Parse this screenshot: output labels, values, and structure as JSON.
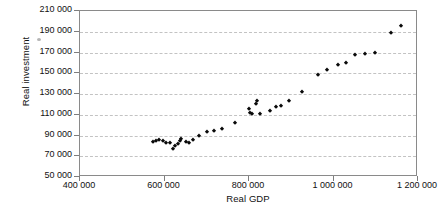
{
  "chart_data": {
    "type": "scatter",
    "title": "",
    "xlabel": "Real GDP",
    "ylabel": "Real investment",
    "xlim": [
      400000,
      1200000
    ],
    "ylim": [
      50000,
      210000
    ],
    "xticks": [
      400000,
      600000,
      800000,
      1000000,
      1200000
    ],
    "yticks": [
      50000,
      70000,
      90000,
      110000,
      130000,
      150000,
      170000,
      190000,
      210000
    ],
    "xtick_labels": [
      "400 000",
      "600 000",
      "800 000",
      "1 000 000",
      "1 200 000"
    ],
    "ytick_labels": [
      "50 000",
      "70 000",
      "90 000",
      "110 000",
      "130 000",
      "150 000",
      "170 000",
      "190 000",
      "210 000"
    ],
    "grid": "horizontal-dashed",
    "legend": null,
    "marker": "filled-diamond",
    "marker_color": "#0a0a0a",
    "points": [
      {
        "x": 573000,
        "y": 84000
      },
      {
        "x": 580000,
        "y": 85000
      },
      {
        "x": 588000,
        "y": 86000
      },
      {
        "x": 596000,
        "y": 85000
      },
      {
        "x": 604000,
        "y": 83000
      },
      {
        "x": 613000,
        "y": 83000
      },
      {
        "x": 620000,
        "y": 77000
      },
      {
        "x": 625000,
        "y": 80000
      },
      {
        "x": 631000,
        "y": 82000
      },
      {
        "x": 636000,
        "y": 85000
      },
      {
        "x": 640000,
        "y": 87000
      },
      {
        "x": 650000,
        "y": 84000
      },
      {
        "x": 657000,
        "y": 83000
      },
      {
        "x": 667000,
        "y": 86000
      },
      {
        "x": 682000,
        "y": 90000
      },
      {
        "x": 700000,
        "y": 93000
      },
      {
        "x": 718000,
        "y": 94000
      },
      {
        "x": 737000,
        "y": 96000
      },
      {
        "x": 768000,
        "y": 102000
      },
      {
        "x": 800000,
        "y": 116000
      },
      {
        "x": 803000,
        "y": 112000
      },
      {
        "x": 808000,
        "y": 111000
      },
      {
        "x": 817000,
        "y": 120000
      },
      {
        "x": 820000,
        "y": 123000
      },
      {
        "x": 826000,
        "y": 111000
      },
      {
        "x": 849000,
        "y": 114000
      },
      {
        "x": 864000,
        "y": 117000
      },
      {
        "x": 876000,
        "y": 118000
      },
      {
        "x": 895000,
        "y": 123000
      },
      {
        "x": 925000,
        "y": 132000
      },
      {
        "x": 963000,
        "y": 148000
      },
      {
        "x": 984000,
        "y": 153000
      },
      {
        "x": 1010000,
        "y": 158000
      },
      {
        "x": 1029000,
        "y": 160000
      },
      {
        "x": 1052000,
        "y": 168000
      },
      {
        "x": 1074000,
        "y": 169000
      },
      {
        "x": 1098000,
        "y": 170000
      },
      {
        "x": 1135000,
        "y": 189000
      },
      {
        "x": 1159000,
        "y": 196000
      }
    ]
  }
}
